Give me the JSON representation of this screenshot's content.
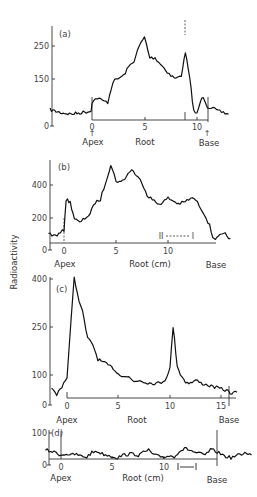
{
  "figure": {
    "ylabel": "Radioactivity"
  },
  "chart_data": [
    {
      "type": "line",
      "panel": "(a)",
      "title": "",
      "xlabel": "Root",
      "ylabel": "Radioactivity",
      "apex_label": "Apex",
      "base_label": "Base",
      "xticks": [
        "0",
        "5",
        "10"
      ],
      "yticks": [
        "0",
        "150",
        "250"
      ],
      "xlim": [
        -4,
        13
      ],
      "ylim": [
        0,
        320
      ],
      "apex_x": 0,
      "base_x": 11,
      "peak_marker_x": 8.9,
      "points": [
        [
          -4,
          35
        ],
        [
          -3,
          25
        ],
        [
          -2,
          20
        ],
        [
          -1,
          25
        ],
        [
          -0.1,
          30
        ],
        [
          0,
          60
        ],
        [
          0.5,
          75
        ],
        [
          1,
          65
        ],
        [
          1.5,
          60
        ],
        [
          2,
          130
        ],
        [
          2.5,
          140
        ],
        [
          3,
          150
        ],
        [
          3.5,
          180
        ],
        [
          4,
          200
        ],
        [
          4.5,
          250
        ],
        [
          5,
          280
        ],
        [
          5.5,
          210
        ],
        [
          6,
          210
        ],
        [
          6.5,
          190
        ],
        [
          7,
          170
        ],
        [
          7.5,
          150
        ],
        [
          8,
          140
        ],
        [
          8.5,
          150
        ],
        [
          8.9,
          230
        ],
        [
          9.3,
          140
        ],
        [
          9.7,
          30
        ],
        [
          10,
          20
        ],
        [
          10.3,
          60
        ],
        [
          10.6,
          80
        ],
        [
          11,
          45
        ],
        [
          11.5,
          40
        ],
        [
          12,
          30
        ],
        [
          12.5,
          25
        ],
        [
          13,
          20
        ]
      ]
    },
    {
      "type": "line",
      "panel": "(b)",
      "title": "",
      "xlabel": "Root (cm)",
      "ylabel": "Radioactivity",
      "apex_label": "Apex",
      "base_label": "Base",
      "xticks": [
        "0",
        "5",
        "10"
      ],
      "yticks": [
        "0",
        "200",
        "400"
      ],
      "xlim": [
        -1.5,
        16
      ],
      "ylim": [
        0,
        560
      ],
      "apex_x": 0,
      "base_x": 14.5,
      "markers": [
        {
          "label": "II",
          "x": 9.5
        },
        {
          "label": "I",
          "x": 12.3
        }
      ],
      "points": [
        [
          -1.5,
          70
        ],
        [
          -1,
          50
        ],
        [
          -0.5,
          60
        ],
        [
          0,
          90
        ],
        [
          0.2,
          300
        ],
        [
          0.6,
          280
        ],
        [
          1,
          170
        ],
        [
          1.5,
          140
        ],
        [
          2,
          170
        ],
        [
          2.5,
          200
        ],
        [
          3,
          280
        ],
        [
          3.5,
          300
        ],
        [
          4,
          420
        ],
        [
          4.5,
          540
        ],
        [
          5,
          430
        ],
        [
          5.5,
          420
        ],
        [
          6,
          460
        ],
        [
          6.5,
          510
        ],
        [
          7,
          460
        ],
        [
          7.5,
          420
        ],
        [
          8,
          330
        ],
        [
          8.5,
          300
        ],
        [
          9,
          270
        ],
        [
          9.5,
          280
        ],
        [
          10,
          310
        ],
        [
          10.5,
          290
        ],
        [
          11,
          270
        ],
        [
          11.5,
          280
        ],
        [
          12,
          300
        ],
        [
          12.5,
          310
        ],
        [
          13,
          260
        ],
        [
          13.5,
          200
        ],
        [
          14,
          120
        ],
        [
          14.3,
          40
        ],
        [
          14.7,
          30
        ],
        [
          15,
          50
        ],
        [
          15.5,
          60
        ],
        [
          16,
          30
        ]
      ]
    },
    {
      "type": "line",
      "panel": "(c)",
      "title": "",
      "xlabel": "Root",
      "ylabel": "Radioactivity",
      "apex_label": "Apex",
      "base_label": "Base",
      "xticks": [
        "0",
        "5",
        "10",
        "15"
      ],
      "yticks": [
        "0",
        "100",
        "250",
        "400"
      ],
      "xlim": [
        -1.5,
        17
      ],
      "ylim": [
        0,
        420
      ],
      "apex_x": 0,
      "base_x": 15.8,
      "points": [
        [
          -1.5,
          30
        ],
        [
          -1,
          10
        ],
        [
          -0.5,
          40
        ],
        [
          0,
          70
        ],
        [
          0.4,
          260
        ],
        [
          0.7,
          410
        ],
        [
          1,
          350
        ],
        [
          1.5,
          290
        ],
        [
          2,
          200
        ],
        [
          2.5,
          180
        ],
        [
          3,
          130
        ],
        [
          3.5,
          120
        ],
        [
          4,
          110
        ],
        [
          4.5,
          100
        ],
        [
          5,
          80
        ],
        [
          5.5,
          75
        ],
        [
          6,
          70
        ],
        [
          6.5,
          55
        ],
        [
          7,
          60
        ],
        [
          7.5,
          55
        ],
        [
          8,
          50
        ],
        [
          8.5,
          50
        ],
        [
          9,
          50
        ],
        [
          9.5,
          60
        ],
        [
          10,
          100
        ],
        [
          10.3,
          240
        ],
        [
          10.7,
          110
        ],
        [
          11,
          80
        ],
        [
          11.5,
          55
        ],
        [
          12,
          50
        ],
        [
          12.5,
          60
        ],
        [
          13,
          50
        ],
        [
          13.5,
          45
        ],
        [
          14,
          40
        ],
        [
          14.5,
          35
        ],
        [
          15,
          30
        ],
        [
          15.5,
          25
        ],
        [
          16,
          15
        ],
        [
          16.5,
          20
        ]
      ]
    },
    {
      "type": "line",
      "panel": "(d)",
      "title": "",
      "xlabel": "Root (cm)",
      "ylabel": "Radioactivity",
      "apex_label": "Apex",
      "base_label": "Base",
      "xticks": [
        "0",
        "5",
        "10"
      ],
      "yticks": [
        "0",
        "100"
      ],
      "xlim": [
        -1.5,
        18.5
      ],
      "ylim": [
        0,
        110
      ],
      "apex_x": 0,
      "base_x": 15.3,
      "bracket": [
        11.5,
        13.3
      ],
      "points": [
        [
          -1.5,
          35
        ],
        [
          -1,
          30
        ],
        [
          -0.5,
          25
        ],
        [
          0,
          15
        ],
        [
          0.5,
          20
        ],
        [
          1,
          15
        ],
        [
          1.5,
          18
        ],
        [
          2,
          10
        ],
        [
          2.5,
          8
        ],
        [
          3,
          25
        ],
        [
          3.5,
          30
        ],
        [
          4,
          20
        ],
        [
          4.5,
          15
        ],
        [
          5,
          10
        ],
        [
          5.5,
          5
        ],
        [
          6,
          15
        ],
        [
          6.5,
          18
        ],
        [
          7,
          20
        ],
        [
          7.5,
          15
        ],
        [
          8,
          25
        ],
        [
          8.5,
          35
        ],
        [
          9,
          15
        ],
        [
          9.5,
          10
        ],
        [
          10,
          8
        ],
        [
          10.5,
          12
        ],
        [
          11,
          10
        ],
        [
          11.5,
          30
        ],
        [
          12,
          40
        ],
        [
          12.5,
          35
        ],
        [
          13,
          25
        ],
        [
          13.5,
          20
        ],
        [
          14,
          15
        ],
        [
          14.5,
          35
        ],
        [
          15,
          30
        ],
        [
          15.5,
          20
        ],
        [
          16,
          10
        ],
        [
          16.5,
          5
        ],
        [
          17,
          12
        ],
        [
          17.5,
          18
        ],
        [
          18,
          25
        ],
        [
          18.5,
          15
        ]
      ]
    }
  ],
  "panels": [
    {
      "label": "(a)",
      "xlabel": "Root",
      "apex": "Apex",
      "base": "Base",
      "xticks": [
        "0",
        "5",
        "10"
      ],
      "yticks": [
        "0",
        "150",
        "250"
      ]
    },
    {
      "label": "(b)",
      "xlabel": "Root (cm)",
      "apex": "Apex",
      "base": "Base",
      "xticks": [
        "0",
        "5",
        "10"
      ],
      "yticks": [
        "0",
        "200",
        "400"
      ],
      "marker_ii": "II",
      "marker_i": "I"
    },
    {
      "label": "(c)",
      "xlabel": "Root",
      "apex": "Apex",
      "base": "Base",
      "xticks": [
        "0",
        "5",
        "10",
        "15"
      ],
      "yticks": [
        "0",
        "100",
        "250",
        "400"
      ]
    },
    {
      "label": "(d)",
      "xlabel": "Root (cm)",
      "apex": "Apex",
      "base": "Base",
      "xticks": [
        "0",
        "5",
        "10"
      ],
      "yticks": [
        "0",
        "100"
      ]
    }
  ]
}
